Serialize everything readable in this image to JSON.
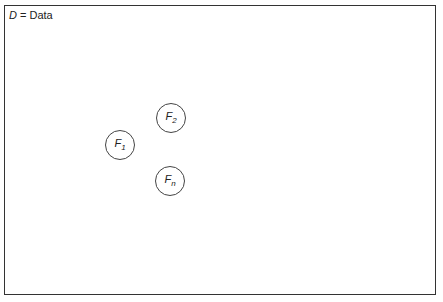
{
  "legend": {
    "symbol": "D",
    "separator": " = ",
    "meaning": "Data"
  },
  "nodes": [
    {
      "letter": "F",
      "sub": "1",
      "cx": 120,
      "cy": 145
    },
    {
      "letter": "F",
      "sub": "2",
      "cx": 171,
      "cy": 118
    },
    {
      "letter": "F",
      "sub": "n",
      "cx": 170,
      "cy": 181
    }
  ]
}
